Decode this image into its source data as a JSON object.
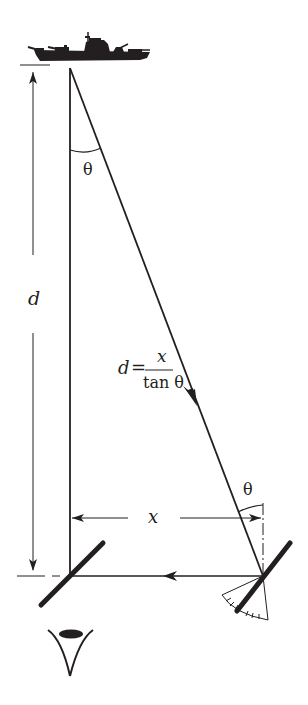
{
  "diagram": {
    "labels": {
      "distance": "d",
      "angle_top": "θ",
      "angle_bottom": "θ",
      "baseline": "x",
      "formula_lhs": "d =",
      "formula_numerator": "x",
      "formula_denominator": "tan θ"
    },
    "elements": {
      "target": "ship-silhouette",
      "observer": "eye",
      "left_reflector": "fixed-mirror",
      "right_reflector": "rotating-mirror",
      "scale": "protractor-scale"
    },
    "colors": {
      "ink": "#231f20",
      "background": "#ffffff"
    }
  }
}
